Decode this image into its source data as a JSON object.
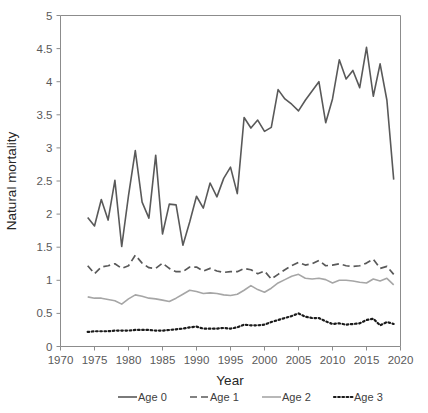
{
  "chart_data": {
    "type": "line",
    "title": "",
    "xlabel": "Year",
    "ylabel": "Natural mortality",
    "xlim": [
      1970,
      2020
    ],
    "ylim": [
      0,
      5
    ],
    "xticks": [
      1970,
      1975,
      1980,
      1985,
      1990,
      1995,
      2000,
      2005,
      2010,
      2015,
      2020
    ],
    "yticks": [
      0,
      0.5,
      1,
      1.5,
      2,
      2.5,
      3,
      3.5,
      4,
      4.5,
      5
    ],
    "xtick_labels": [
      "1970",
      "1975",
      "1980",
      "1985",
      "1990",
      "1995",
      "2000",
      "2005",
      "2010",
      "2015",
      "2020"
    ],
    "ytick_labels": [
      "0",
      "0.5",
      "1",
      "1.5",
      "2",
      "2.5",
      "3",
      "3.5",
      "4",
      "4.5",
      "5"
    ],
    "grid": false,
    "legend_position": "bottom",
    "x": [
      1974,
      1975,
      1976,
      1977,
      1978,
      1979,
      1980,
      1981,
      1982,
      1983,
      1984,
      1985,
      1986,
      1987,
      1988,
      1989,
      1990,
      1991,
      1992,
      1993,
      1994,
      1995,
      1996,
      1997,
      1998,
      1999,
      2000,
      2001,
      2002,
      2003,
      2004,
      2005,
      2006,
      2007,
      2008,
      2009,
      2010,
      2011,
      2012,
      2013,
      2014,
      2015,
      2016,
      2017,
      2018,
      2019
    ],
    "series": [
      {
        "name": "Age 0",
        "style": "solid",
        "color": "#595959",
        "values": [
          1.95,
          1.82,
          2.22,
          1.91,
          2.51,
          1.51,
          2.28,
          2.96,
          2.18,
          1.94,
          2.89,
          1.7,
          2.15,
          2.14,
          1.53,
          1.88,
          2.27,
          2.09,
          2.47,
          2.26,
          2.54,
          2.71,
          2.31,
          3.46,
          3.3,
          3.42,
          3.25,
          3.31,
          3.88,
          3.74,
          3.66,
          3.56,
          3.72,
          3.86,
          4.0,
          3.38,
          3.74,
          4.33,
          4.04,
          4.17,
          3.91,
          4.52,
          3.78,
          4.27,
          3.72,
          2.52
        ]
      },
      {
        "name": "Age 1",
        "style": "dashed",
        "color": "#595959",
        "values": [
          1.22,
          1.1,
          1.2,
          1.22,
          1.25,
          1.18,
          1.22,
          1.38,
          1.26,
          1.19,
          1.18,
          1.26,
          1.18,
          1.13,
          1.13,
          1.2,
          1.2,
          1.14,
          1.18,
          1.14,
          1.12,
          1.13,
          1.13,
          1.18,
          1.16,
          1.1,
          1.14,
          1.02,
          1.09,
          1.16,
          1.22,
          1.27,
          1.23,
          1.25,
          1.3,
          1.22,
          1.23,
          1.25,
          1.22,
          1.21,
          1.22,
          1.26,
          1.32,
          1.18,
          1.21,
          1.09
        ]
      },
      {
        "name": "Age 2",
        "style": "solid-light",
        "color": "#a6a6a6",
        "values": [
          0.75,
          0.73,
          0.73,
          0.71,
          0.69,
          0.64,
          0.72,
          0.78,
          0.76,
          0.73,
          0.72,
          0.7,
          0.68,
          0.73,
          0.79,
          0.85,
          0.83,
          0.8,
          0.81,
          0.8,
          0.78,
          0.77,
          0.79,
          0.85,
          0.92,
          0.86,
          0.82,
          0.88,
          0.96,
          1.01,
          1.06,
          1.09,
          1.03,
          1.02,
          1.03,
          1.01,
          0.96,
          1.0,
          1.0,
          0.99,
          0.97,
          0.96,
          1.02,
          0.99,
          1.03,
          0.93
        ]
      },
      {
        "name": "Age 3",
        "style": "dotted",
        "color": "#1a1a1a",
        "values": [
          0.22,
          0.23,
          0.23,
          0.23,
          0.24,
          0.24,
          0.24,
          0.25,
          0.25,
          0.25,
          0.24,
          0.24,
          0.25,
          0.26,
          0.27,
          0.29,
          0.3,
          0.27,
          0.27,
          0.27,
          0.28,
          0.27,
          0.29,
          0.33,
          0.32,
          0.32,
          0.33,
          0.37,
          0.4,
          0.43,
          0.46,
          0.5,
          0.45,
          0.43,
          0.43,
          0.38,
          0.34,
          0.35,
          0.33,
          0.34,
          0.35,
          0.4,
          0.42,
          0.32,
          0.37,
          0.34
        ]
      }
    ]
  },
  "axes": {
    "x_title": "Year",
    "y_title": "Natural mortality"
  },
  "legend": {
    "items": [
      {
        "label": "Age 0"
      },
      {
        "label": "Age 1"
      },
      {
        "label": "Age 2"
      },
      {
        "label": "Age 3"
      }
    ]
  }
}
